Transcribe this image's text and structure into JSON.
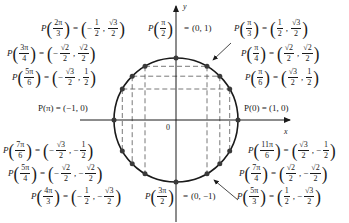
{
  "diagram": {
    "axes": {
      "x_label": "x",
      "y_label": "y",
      "origin_label": "0"
    },
    "colors": {
      "ink": "#1a1a1a",
      "point": "#3a3a3a",
      "dash": "#555555"
    },
    "labels": {
      "p2pi3": {
        "fn": "P",
        "arg_num": "2π",
        "arg_den": "3",
        "eq": "=",
        "x_sign": "−",
        "x_num": "1",
        "x_den": "2",
        "y_sign": "",
        "y_num": "√3",
        "y_den": "2"
      },
      "p3pi4": {
        "fn": "P",
        "arg_num": "3π",
        "arg_den": "4",
        "eq": "=",
        "x_sign": "−",
        "x_num": "√2",
        "x_den": "2",
        "y_sign": "",
        "y_num": "√2",
        "y_den": "2"
      },
      "p5pi6": {
        "fn": "P",
        "arg_num": "5π",
        "arg_den": "6",
        "eq": "=",
        "x_sign": "−",
        "x_num": "√3",
        "x_den": "2",
        "y_sign": "",
        "y_num": "1",
        "y_den": "2"
      },
      "ppi": {
        "text": "P(π) = (−1, 0)"
      },
      "p7pi6": {
        "fn": "P",
        "arg_num": "7π",
        "arg_den": "6",
        "eq": "=",
        "x_sign": "−",
        "x_num": "√3",
        "x_den": "2",
        "y_sign": "−",
        "y_num": "1",
        "y_den": "2"
      },
      "p5pi4": {
        "fn": "P",
        "arg_num": "5π",
        "arg_den": "4",
        "eq": "=",
        "x_sign": "−",
        "x_num": "√2",
        "x_den": "2",
        "y_sign": "−",
        "y_num": "√2",
        "y_den": "2"
      },
      "p4pi3": {
        "fn": "P",
        "arg_num": "4π",
        "arg_den": "3",
        "eq": "=",
        "x_sign": "−",
        "x_num": "1",
        "x_den": "2",
        "y_sign": "−",
        "y_num": "√3",
        "y_den": "2"
      },
      "ppi2": {
        "fn": "P",
        "arg_num": "π",
        "arg_den": "2",
        "eq": "=",
        "value": "(0, 1)"
      },
      "p3pi2": {
        "fn": "P",
        "arg_num": "3π",
        "arg_den": "2",
        "eq": "=",
        "value": "(0, −1)"
      },
      "ppi3": {
        "fn": "P",
        "arg_num": "π",
        "arg_den": "3",
        "eq": "=",
        "x_sign": "",
        "x_num": "1",
        "x_den": "2",
        "y_sign": "",
        "y_num": "√3",
        "y_den": "2"
      },
      "ppi4": {
        "fn": "P",
        "arg_num": "π",
        "arg_den": "4",
        "eq": "=",
        "x_sign": "",
        "x_num": "√2",
        "x_den": "2",
        "y_sign": "",
        "y_num": "√2",
        "y_den": "2"
      },
      "ppi6": {
        "fn": "P",
        "arg_num": "π",
        "arg_den": "6",
        "eq": "=",
        "x_sign": "",
        "x_num": "√3",
        "x_den": "2",
        "y_sign": "",
        "y_num": "1",
        "y_den": "2"
      },
      "p0": {
        "text": "P(0) = (1, 0)"
      },
      "p11pi6": {
        "fn": "P",
        "arg_num": "11π",
        "arg_den": "6",
        "eq": "=",
        "x_sign": "",
        "x_num": "√3",
        "x_den": "2",
        "y_sign": "−",
        "y_num": "1",
        "y_den": "2"
      },
      "p7pi4": {
        "fn": "P",
        "arg_num": "7π",
        "arg_den": "4",
        "eq": "=",
        "x_sign": "",
        "x_num": "√2",
        "x_den": "2",
        "y_sign": "−",
        "y_num": "√2",
        "y_den": "2"
      },
      "p5pi3": {
        "fn": "P",
        "arg_num": "5π",
        "arg_den": "3",
        "eq": "=",
        "x_sign": "",
        "x_num": "1",
        "x_den": "2",
        "y_sign": "−",
        "y_num": "√3",
        "y_den": "2"
      }
    }
  }
}
